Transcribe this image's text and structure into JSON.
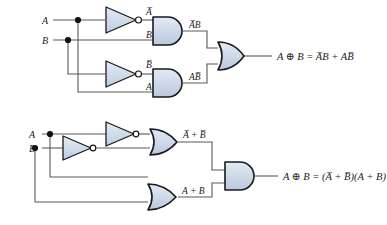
{
  "figure": {
    "background_color": "#ffffff",
    "gate_fill": "#ccd8e8",
    "gate_stroke": "#1a1a1a",
    "wire_color": "#5a5a5a",
    "text_color": "#1a1a1a"
  },
  "circuits": [
    {
      "id": "sum-of-products",
      "name": "AND-OR XOR implementation",
      "inputs": [
        {
          "name": "input-a",
          "label": "A"
        },
        {
          "name": "input-b",
          "label": "B"
        }
      ],
      "gates": [
        {
          "name": "inverter-a",
          "type": "NOT",
          "output_label": "A̅"
        },
        {
          "name": "inverter-b",
          "type": "NOT",
          "output_label": "B̅"
        },
        {
          "name": "and-gate-top",
          "type": "AND",
          "input_labels": [
            "A̅",
            "B"
          ],
          "output_label": "A̅B"
        },
        {
          "name": "and-gate-bottom",
          "type": "AND",
          "input_labels": [
            "B̅",
            "A"
          ],
          "output_label": "AB̅"
        },
        {
          "name": "or-gate-output",
          "type": "OR"
        }
      ],
      "internal_labels": {
        "not_a": "A̅",
        "b_in": "B",
        "not_b": "B̅",
        "a_in": "A",
        "and_top_out": "A̅B",
        "and_bottom_out": "AB̅"
      },
      "output_expression": "A ⊕ B = A̅B + AB̅"
    },
    {
      "id": "product-of-sums",
      "name": "OR-AND XOR implementation",
      "inputs": [
        {
          "name": "input-a",
          "label": "A"
        },
        {
          "name": "input-b",
          "label": "B"
        }
      ],
      "gates": [
        {
          "name": "inverter-a",
          "type": "NOT"
        },
        {
          "name": "inverter-b",
          "type": "NOT"
        },
        {
          "name": "or-gate-top",
          "type": "OR",
          "output_label": "A̅ + B̅"
        },
        {
          "name": "or-gate-bottom",
          "type": "OR",
          "output_label": "A + B"
        },
        {
          "name": "and-gate-output",
          "type": "AND"
        }
      ],
      "internal_labels": {
        "or_top_out": "A̅ + B̅",
        "or_bottom_out": "A + B"
      },
      "output_expression": "A ⊕ B = (A̅ + B̅)(A + B)"
    }
  ]
}
